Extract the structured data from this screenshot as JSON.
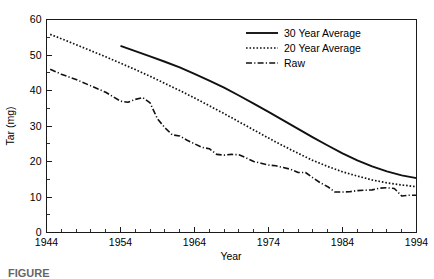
{
  "chart_data": {
    "type": "line",
    "title": "",
    "xlabel": "Year",
    "ylabel": "Tar (mg)",
    "xlim": [
      1944,
      1994
    ],
    "ylim": [
      0,
      60
    ],
    "xticks": [
      1944,
      1954,
      1964,
      1974,
      1984,
      1994
    ],
    "yticks": [
      0,
      10,
      20,
      30,
      40,
      50,
      60
    ],
    "xminor_step": 2,
    "yminor_step": 5,
    "grid": false,
    "legend_position": "top-right",
    "series": [
      {
        "name": "30 Year Average",
        "style": "solid",
        "x": [
          1954,
          1956,
          1958,
          1960,
          1962,
          1964,
          1966,
          1968,
          1970,
          1972,
          1974,
          1976,
          1978,
          1980,
          1982,
          1984,
          1986,
          1988,
          1990,
          1992,
          1994
        ],
        "values": [
          52.6,
          51.1,
          49.6,
          48.1,
          46.5,
          44.7,
          42.8,
          40.8,
          38.6,
          36.3,
          34.0,
          31.6,
          29.2,
          26.8,
          24.5,
          22.3,
          20.3,
          18.6,
          17.2,
          16.1,
          15.3
        ]
      },
      {
        "name": "20 Year Average",
        "style": "dotted",
        "x": [
          1944.5,
          1946,
          1948,
          1950,
          1952,
          1954,
          1956,
          1958,
          1960,
          1962,
          1964,
          1966,
          1968,
          1970,
          1972,
          1974,
          1976,
          1978,
          1980,
          1982,
          1984,
          1986,
          1988,
          1990,
          1992,
          1994
        ],
        "values": [
          55.8,
          54.6,
          52.9,
          51.2,
          49.5,
          47.7,
          45.9,
          44.0,
          42.0,
          40.0,
          37.9,
          35.7,
          33.5,
          31.2,
          28.9,
          26.6,
          24.4,
          22.3,
          20.3,
          18.6,
          17.1,
          15.9,
          14.8,
          14.0,
          13.4,
          12.9
        ]
      },
      {
        "name": "Raw",
        "style": "dash-dot",
        "x": [
          1944.5,
          1946,
          1948,
          1950,
          1952,
          1954,
          1955,
          1956,
          1957,
          1958,
          1959,
          1960,
          1961,
          1962,
          1963,
          1964,
          1965,
          1966,
          1967,
          1968,
          1969,
          1970,
          1971,
          1972,
          1973,
          1974,
          1975,
          1976,
          1977,
          1978,
          1979,
          1980,
          1981,
          1982,
          1983,
          1984,
          1985,
          1986,
          1987,
          1988,
          1989,
          1990,
          1991,
          1992,
          1993,
          1994
        ],
        "values": [
          46.0,
          44.6,
          43.1,
          41.3,
          39.5,
          37.0,
          36.7,
          37.5,
          38.0,
          36.5,
          32.0,
          29.5,
          27.5,
          27.2,
          26.0,
          25.0,
          24.0,
          23.6,
          22.0,
          21.8,
          22.0,
          21.9,
          21.0,
          20.0,
          19.5,
          19.0,
          18.8,
          18.3,
          17.8,
          16.9,
          16.9,
          15.4,
          14.0,
          12.9,
          11.4,
          11.4,
          11.5,
          11.8,
          11.9,
          12.0,
          12.5,
          12.6,
          12.4,
          10.3,
          10.5,
          10.5
        ]
      }
    ]
  },
  "legend": {
    "items": [
      {
        "label": "30 Year Average"
      },
      {
        "label": "20 Year Average"
      },
      {
        "label": "Raw"
      }
    ]
  },
  "caption": {
    "text": "FIGURE"
  }
}
